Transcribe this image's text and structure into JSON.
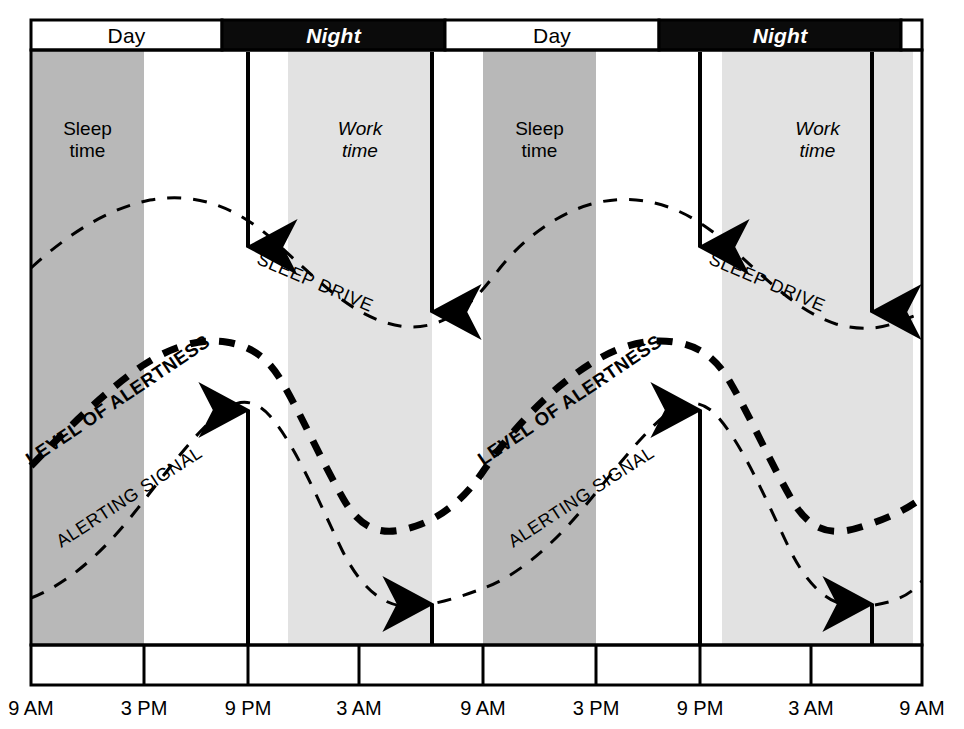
{
  "figure": {
    "kind": "two-process-model-circadian-diagram",
    "background": "#ffffff",
    "ink": "#000000"
  },
  "colors": {
    "sleep_band": "#b8b8b8",
    "work_band": "#e2e2e2",
    "night_bar": "#0b0b0b",
    "day_bar": "#ffffff",
    "ink": "#000000"
  },
  "day_night_bar": {
    "segments": [
      {
        "label": "Day",
        "style": "day",
        "x": 31,
        "w": 191
      },
      {
        "label": "Night",
        "style": "night",
        "x": 222,
        "w": 223
      },
      {
        "label": "Day",
        "style": "day",
        "x": 445,
        "w": 214
      },
      {
        "label": "Night",
        "style": "night",
        "x": 659,
        "w": 242
      },
      {
        "label": "",
        "style": "day",
        "x": 901,
        "w": 21
      }
    ]
  },
  "shaded_bands": [
    {
      "name": "sleep-band-1",
      "label": "Sleep\ntime",
      "italic": false,
      "fill": "#b8b8b8",
      "x": 31,
      "w": 113
    },
    {
      "name": "work-band-1",
      "label": "Work\ntime",
      "italic": true,
      "fill": "#e2e2e2",
      "x": 288,
      "w": 144
    },
    {
      "name": "sleep-band-2",
      "label": "Sleep\ntime",
      "italic": false,
      "fill": "#b8b8b8",
      "x": 483,
      "w": 113
    },
    {
      "name": "work-band-2",
      "label": "Work\ntime",
      "italic": true,
      "fill": "#e2e2e2",
      "x": 722,
      "w": 191
    }
  ],
  "axis": {
    "tick_labels": [
      "9 AM",
      "3 PM",
      "9 PM",
      "3 AM",
      "9 AM",
      "3 PM",
      "9 PM",
      "3 AM",
      "9 AM"
    ],
    "tick_x": [
      31,
      144,
      248,
      359,
      483,
      596,
      700,
      811,
      922
    ]
  },
  "curves": [
    {
      "name": "sleep-drive",
      "label": "SLEEP DRIVE",
      "weight": "thin",
      "stroke_width": 3,
      "dash": "14 12",
      "label_x": 258,
      "label_y": 249,
      "label_rotate": 23
    },
    {
      "name": "level-of-alertness",
      "label": "LEVEL OF ALERTNESS",
      "weight": "thick",
      "stroke_width": 7,
      "dash": "16 13",
      "label_x": 28,
      "label_y": 452,
      "label_rotate": -34
    },
    {
      "name": "alerting-signal",
      "label": "ALERTING SIGNAL",
      "weight": "thin",
      "stroke_width": 3,
      "dash": "14 12",
      "label_x": 58,
      "label_y": 534,
      "label_rotate": -33
    },
    {
      "name": "level-of-alertness-2-label",
      "label": "LEVEL OF ALERTNESS",
      "weight": "thick",
      "stroke_width": 7,
      "dash": "16 13",
      "label_x": 480,
      "label_y": 452,
      "label_rotate": -34
    },
    {
      "name": "sleep-drive-2-label",
      "label": "SLEEP DRIVE",
      "weight": "thin",
      "stroke_width": 3,
      "dash": "14 12",
      "label_x": 710,
      "label_y": 249,
      "label_rotate": 23
    },
    {
      "name": "alerting-signal-2-label",
      "label": "ALERTING SIGNAL",
      "weight": "thin",
      "stroke_width": 3,
      "dash": "14 12",
      "label_x": 510,
      "label_y": 534,
      "label_rotate": -33
    }
  ],
  "arrows": [
    {
      "name": "arrow-down-sleep-drive-1",
      "direction": "down",
      "x": 248,
      "y_start": 52,
      "y_end": 247
    },
    {
      "name": "arrow-down-sleep-drive-2",
      "direction": "down",
      "x": 432,
      "y_start": 52,
      "y_end": 312
    },
    {
      "name": "arrow-down-sleep-drive-3",
      "direction": "down",
      "x": 700,
      "y_start": 52,
      "y_end": 247
    },
    {
      "name": "arrow-down-sleep-drive-4",
      "direction": "down",
      "x": 872,
      "y_start": 52,
      "y_end": 312
    },
    {
      "name": "arrow-up-alerting-signal-1",
      "direction": "up",
      "x": 248,
      "y_start": 644,
      "y_end": 410
    },
    {
      "name": "arrow-up-alerting-signal-2",
      "direction": "up",
      "x": 432,
      "y_start": 644,
      "y_end": 604
    },
    {
      "name": "arrow-up-alerting-signal-3",
      "direction": "up",
      "x": 700,
      "y_start": 644,
      "y_end": 410
    },
    {
      "name": "arrow-up-alerting-signal-4",
      "direction": "up",
      "x": 872,
      "y_start": 644,
      "y_end": 604
    }
  ],
  "chart_data": {
    "type": "line",
    "title": "",
    "xlabel": "",
    "ylabel": "",
    "grid": false,
    "legend_position": "inline-curve-labels",
    "x_tick_labels": [
      "9 AM",
      "3 PM",
      "9 PM",
      "3 AM",
      "9 AM",
      "3 PM",
      "9 PM",
      "3 AM",
      "9 AM"
    ],
    "x_hours_from_start": [
      0,
      6,
      12,
      18,
      24,
      30,
      36,
      42,
      48
    ],
    "xlim": [
      0,
      48
    ],
    "ylim": [
      0,
      100
    ],
    "note": "y values are relative alertness/drive units read off curve heights (0 = bottom axis, 100 = top of plot area)",
    "series": [
      {
        "name": "SLEEP DRIVE",
        "style": "thin dashed",
        "x": [
          0,
          3,
          6,
          9,
          12,
          15,
          18,
          21,
          24,
          27,
          30,
          33,
          36,
          39,
          42,
          45,
          48
        ],
        "values": [
          62,
          69,
          73,
          71,
          66,
          57,
          48,
          45,
          50,
          60,
          69,
          73,
          71,
          66,
          57,
          48,
          47
        ]
      },
      {
        "name": "LEVEL OF ALERTNESS",
        "style": "thick dashed",
        "x": [
          0,
          3,
          6,
          9,
          12,
          15,
          18,
          21,
          24,
          27,
          30,
          33,
          36,
          39,
          42,
          45,
          48
        ],
        "values": [
          30,
          42,
          50,
          51,
          44,
          32,
          23,
          20,
          23,
          35,
          48,
          53,
          49,
          38,
          26,
          21,
          24
        ]
      },
      {
        "name": "ALERTING SIGNAL",
        "style": "thin dashed",
        "x": [
          0,
          3,
          6,
          9,
          12,
          15,
          18,
          21,
          24,
          27,
          30,
          33,
          36,
          39,
          42,
          45,
          48
        ],
        "values": [
          9,
          19,
          30,
          36,
          33,
          23,
          12,
          8,
          10,
          20,
          32,
          38,
          34,
          23,
          12,
          9,
          10
        ]
      }
    ],
    "annotations": [
      {
        "text": "Day",
        "kind": "period-bar",
        "span": "9 AM - 9 PM"
      },
      {
        "text": "Night",
        "kind": "period-bar",
        "span": "9 PM - 9 AM"
      },
      {
        "text": "Sleep time",
        "kind": "shaded-band",
        "shade": "dark-gray"
      },
      {
        "text": "Work time",
        "kind": "shaded-band",
        "shade": "light-gray"
      }
    ]
  }
}
